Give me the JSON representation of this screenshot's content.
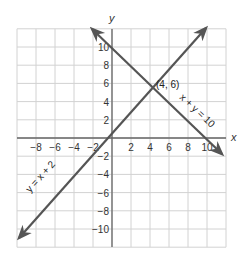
{
  "chart_data": {
    "type": "line",
    "title": "",
    "xlabel": "x",
    "ylabel": "y",
    "xlim": [
      -10,
      12
    ],
    "ylim": [
      -12,
      12
    ],
    "grid": true,
    "x_ticks": [
      -8,
      -6,
      -4,
      -2,
      2,
      4,
      6,
      8,
      10
    ],
    "y_ticks": [
      10,
      8,
      6,
      4,
      2,
      -2,
      -4,
      -6,
      -8,
      -10
    ],
    "series": [
      {
        "name": "y = x + 2",
        "equation": "y = x + 2",
        "points": [
          [
            -10,
            -8
          ],
          [
            11.5,
            13.5
          ]
        ]
      },
      {
        "name": "x + y = 10",
        "equation": "x + y = 10",
        "points": [
          [
            -2,
            12
          ],
          [
            11.5,
            -1.5
          ]
        ]
      }
    ],
    "annotations": [
      {
        "text": "(4, 6)",
        "x": 4,
        "y": 6
      },
      {
        "text": "x + y = 10"
      },
      {
        "text": "y = x + 2"
      }
    ],
    "colors": {
      "lines": "#555555",
      "grid": "#cfcfcf",
      "axes": "#666666"
    }
  },
  "labels": {
    "x_axis": "x",
    "y_axis": "y",
    "intersection": "(4, 6)",
    "line1": "y = x + 2",
    "line2": "x + y = 10",
    "xticks": [
      "−8",
      "−6",
      "−4",
      "−2",
      "2",
      "4",
      "6",
      "8",
      "10"
    ],
    "yticks": [
      "10",
      "8",
      "6",
      "4",
      "2",
      "−2",
      "−4",
      "−6",
      "−8",
      "−10"
    ]
  }
}
